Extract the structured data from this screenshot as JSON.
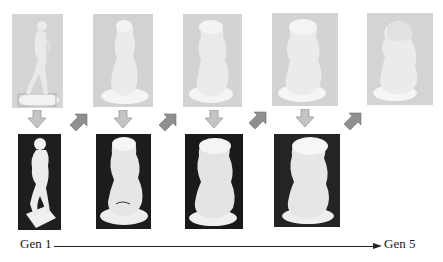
{
  "figure": {
    "type": "process-diagram",
    "top_row": [
      {
        "id": "render-gen1",
        "subject": "human-figure-statue",
        "style": "light-gray-render"
      },
      {
        "id": "render-gen2",
        "subject": "blob-sculpture",
        "style": "light-gray-render"
      },
      {
        "id": "render-gen3",
        "subject": "blob-sculpture",
        "style": "light-gray-render"
      },
      {
        "id": "render-gen4",
        "subject": "blob-sculpture",
        "style": "light-gray-render"
      },
      {
        "id": "render-gen5",
        "subject": "blob-sculpture",
        "style": "light-gray-render"
      }
    ],
    "bottom_row": [
      {
        "id": "photo-gen1",
        "subject": "human-figure-statue",
        "style": "white-object-dark-background"
      },
      {
        "id": "photo-gen2",
        "subject": "blob-sculpture",
        "style": "white-object-dark-background"
      },
      {
        "id": "photo-gen3",
        "subject": "blob-sculpture",
        "style": "white-object-dark-background"
      },
      {
        "id": "photo-gen4",
        "subject": "blob-sculpture",
        "style": "white-object-dark-background"
      }
    ],
    "arrows": {
      "down": 4,
      "diagonal_up_right": 4,
      "color": "#b9b9b9",
      "diagonal_color": "#8e8e8e"
    },
    "timeline": {
      "start_label": "Gen 1",
      "end_label": "Gen 5"
    }
  }
}
